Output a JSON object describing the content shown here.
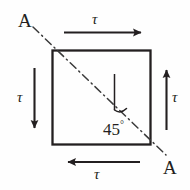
{
  "figure": {
    "background_color": "#fefefe",
    "ink_color": "#231f20",
    "element": {
      "name": "square-element",
      "x": 52,
      "y": 50,
      "width": 99,
      "height": 95,
      "stroke_width": 2.2
    },
    "shear_arrows": [
      {
        "id": "top",
        "label": "τ",
        "direction": "right",
        "label_position": "above"
      },
      {
        "id": "bottom",
        "label": "τ",
        "direction": "left",
        "label_position": "below"
      },
      {
        "id": "left",
        "label": "τ",
        "direction": "down",
        "label_position": "left"
      },
      {
        "id": "right",
        "label": "τ",
        "direction": "up",
        "label_position": "right"
      }
    ],
    "section_line": {
      "style": "dash-dot",
      "from_label": "A",
      "to_label": "A",
      "orientation": "top-left to bottom-right diagonal"
    },
    "angle_annotation": {
      "value": "45",
      "unit": "°",
      "text": "45",
      "degree_symbol": "°"
    },
    "labels": {
      "tau_top": "τ",
      "tau_bottom": "τ",
      "tau_left": "τ",
      "tau_right": "τ",
      "section_a_top_left": "A",
      "section_a_bottom_right": "A",
      "angle_value": "45",
      "angle_degree": "°"
    }
  }
}
